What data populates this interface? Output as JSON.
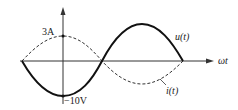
{
  "diagram": {
    "type": "waveform",
    "x_axis_label": "ωt",
    "labels": {
      "current_peak": "3A",
      "voltage_peak": "−10V",
      "voltage_curve": "u(t)",
      "current_curve": "i(t)"
    },
    "series": [
      {
        "name": "u(t)",
        "style": "solid",
        "amplitude": "10V",
        "value_at_origin": "-10V"
      },
      {
        "name": "i(t)",
        "style": "dashed",
        "amplitude": "3A",
        "value_at_origin": "3A"
      }
    ],
    "colors": {
      "line": "#1a1a1a",
      "axis": "#333333"
    }
  }
}
